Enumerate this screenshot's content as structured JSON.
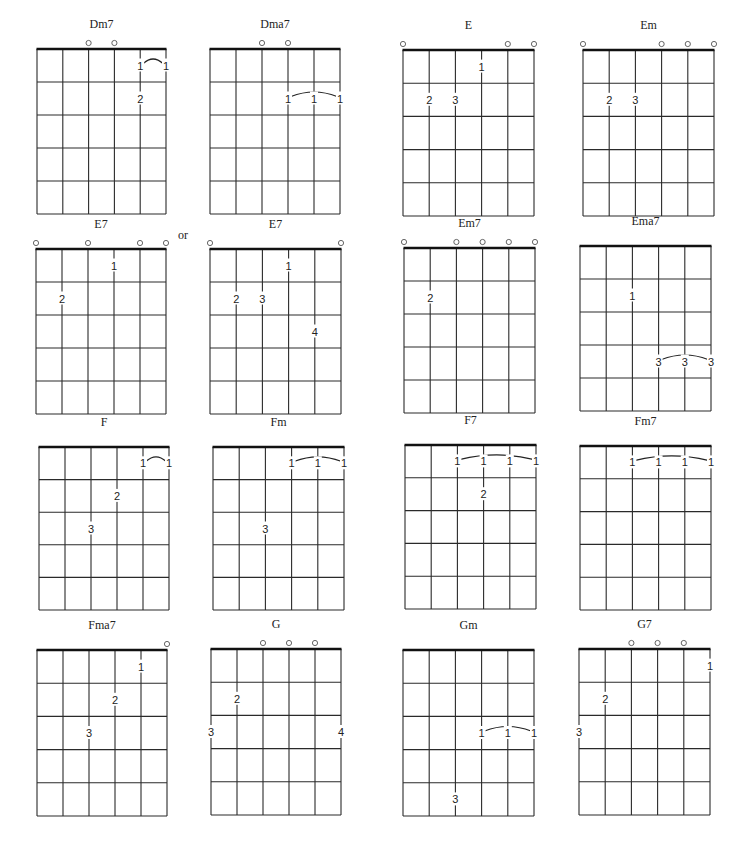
{
  "page": {
    "or_label": "or",
    "colors": {
      "ink": "#1a1a1a",
      "grid": "#2a2a2a",
      "open_string": "#555555",
      "background": "#ffffff"
    }
  },
  "diagram_conventions": {
    "strings": 6,
    "frets_shown": 5,
    "string_order": "left = low E (6th), right = high E (1st)",
    "open_marker": "circle above nut",
    "finger_numbers": "1-4 placed on string within fret",
    "barre": "arc connecting finger positions"
  },
  "chords": [
    {
      "name": "Dm7",
      "x": 37,
      "y": 49,
      "w": 129,
      "h": 165,
      "open": [
        3,
        4
      ],
      "fingers": [
        {
          "s": 5,
          "f": 2,
          "n": "2"
        }
      ],
      "barres": [
        {
          "from": 5,
          "to": 6,
          "f": 1,
          "n": "1"
        }
      ]
    },
    {
      "name": "Dma7",
      "x": 210,
      "y": 49,
      "w": 130,
      "h": 165,
      "open": [
        3,
        4
      ],
      "fingers": [],
      "barres": [
        {
          "from": 4,
          "to": 6,
          "f": 2,
          "n": "1"
        }
      ]
    },
    {
      "name": "E",
      "x": 403,
      "y": 50,
      "w": 131,
      "h": 166,
      "open": [
        1,
        5,
        6
      ],
      "fingers": [
        {
          "s": 2,
          "f": 2,
          "n": "2"
        },
        {
          "s": 3,
          "f": 2,
          "n": "3"
        },
        {
          "s": 4,
          "f": 1,
          "n": "1"
        }
      ],
      "barres": []
    },
    {
      "name": "Em",
      "x": 583,
      "y": 50,
      "w": 131,
      "h": 166,
      "open": [
        1,
        4,
        5,
        6
      ],
      "fingers": [
        {
          "s": 2,
          "f": 2,
          "n": "2"
        },
        {
          "s": 3,
          "f": 2,
          "n": "3"
        }
      ],
      "barres": []
    },
    {
      "name": "E7",
      "x": 36,
      "y": 249,
      "w": 130,
      "h": 165,
      "open": [
        1,
        3,
        5,
        6
      ],
      "fingers": [
        {
          "s": 2,
          "f": 2,
          "n": "2"
        },
        {
          "s": 4,
          "f": 1,
          "n": "1"
        }
      ],
      "barres": []
    },
    {
      "name": "E7",
      "x": 210,
      "y": 249,
      "w": 131,
      "h": 165,
      "open": [
        1,
        6
      ],
      "fingers": [
        {
          "s": 2,
          "f": 2,
          "n": "2"
        },
        {
          "s": 3,
          "f": 2,
          "n": "3"
        },
        {
          "s": 4,
          "f": 1,
          "n": "1"
        },
        {
          "s": 5,
          "f": 3,
          "n": "4"
        }
      ],
      "barres": []
    },
    {
      "name": "Em7",
      "x": 404,
      "y": 248,
      "w": 131,
      "h": 165,
      "open": [
        1,
        3,
        4,
        5,
        6
      ],
      "fingers": [
        {
          "s": 2,
          "f": 2,
          "n": "2"
        }
      ],
      "barres": []
    },
    {
      "name": "Ema7",
      "x": 580,
      "y": 246,
      "w": 131,
      "h": 165,
      "open": [],
      "fingers": [
        {
          "s": 3,
          "f": 2,
          "n": "1"
        }
      ],
      "barres": [
        {
          "from": 4,
          "to": 6,
          "f": 4,
          "n": "3"
        }
      ]
    },
    {
      "name": "F",
      "x": 39,
      "y": 447,
      "w": 130,
      "h": 163,
      "open": [],
      "fingers": [
        {
          "s": 3,
          "f": 3,
          "n": "3"
        },
        {
          "s": 4,
          "f": 2,
          "n": "2"
        }
      ],
      "barres": [
        {
          "from": 5,
          "to": 6,
          "f": 1,
          "n": "1"
        }
      ]
    },
    {
      "name": "Fm",
      "x": 213,
      "y": 447,
      "w": 131,
      "h": 163,
      "open": [],
      "fingers": [
        {
          "s": 3,
          "f": 3,
          "n": "3"
        }
      ],
      "barres": [
        {
          "from": 4,
          "to": 6,
          "f": 1,
          "n": "1"
        }
      ]
    },
    {
      "name": "F7",
      "x": 405,
      "y": 445,
      "w": 131,
      "h": 164,
      "open": [],
      "fingers": [
        {
          "s": 4,
          "f": 2,
          "n": "2"
        }
      ],
      "barres": [
        {
          "from": 3,
          "to": 6,
          "f": 1,
          "n": "1"
        }
      ]
    },
    {
      "name": "Fm7",
      "x": 580,
      "y": 446,
      "w": 131,
      "h": 164,
      "open": [],
      "fingers": [],
      "barres": [
        {
          "from": 3,
          "to": 6,
          "f": 1,
          "n": "1"
        }
      ]
    },
    {
      "name": "Fma7",
      "x": 37,
      "y": 650,
      "w": 130,
      "h": 166,
      "open": [
        6
      ],
      "fingers": [
        {
          "s": 3,
          "f": 3,
          "n": "3"
        },
        {
          "s": 4,
          "f": 2,
          "n": "2"
        },
        {
          "s": 5,
          "f": 1,
          "n": "1"
        }
      ],
      "barres": []
    },
    {
      "name": "G",
      "x": 211,
      "y": 649,
      "w": 130,
      "h": 166,
      "open": [
        3,
        4,
        5
      ],
      "fingers": [
        {
          "s": 1,
          "f": 3,
          "n": "3"
        },
        {
          "s": 2,
          "f": 2,
          "n": "2"
        },
        {
          "s": 6,
          "f": 3,
          "n": "4"
        }
      ],
      "barres": []
    },
    {
      "name": "Gm",
      "x": 403,
      "y": 650,
      "w": 131,
      "h": 166,
      "open": [],
      "fingers": [
        {
          "s": 3,
          "f": 5,
          "n": "3"
        }
      ],
      "barres": [
        {
          "from": 4,
          "to": 6,
          "f": 3,
          "n": "1"
        }
      ]
    },
    {
      "name": "G7",
      "x": 579,
      "y": 649,
      "w": 131,
      "h": 166,
      "open": [
        3,
        4,
        5
      ],
      "fingers": [
        {
          "s": 1,
          "f": 3,
          "n": "3"
        },
        {
          "s": 2,
          "f": 2,
          "n": "2"
        },
        {
          "s": 6,
          "f": 1,
          "n": "1"
        }
      ],
      "barres": []
    }
  ]
}
